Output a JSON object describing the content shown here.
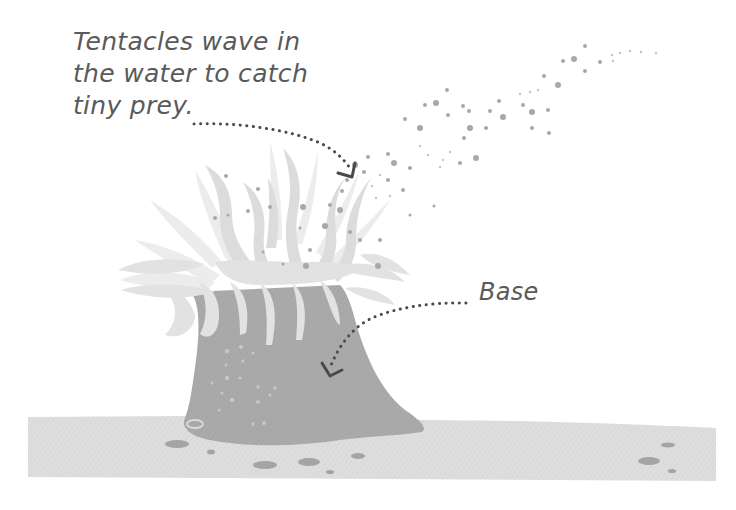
{
  "diagram": {
    "labels": {
      "tentacles": {
        "lines": [
          "Tentacles wave in",
          "the water to catch",
          "tiny prey."
        ]
      },
      "base": {
        "text": "Base"
      }
    },
    "colors": {
      "background": "#ffffff",
      "text": "#5a5a5a",
      "arrow": "#4a4a4a",
      "tentacles_light": "#e6e6e6",
      "tentacles_mid": "#d4d4d4",
      "body": "#a8a8a8",
      "seafloor": "#dcdcdc",
      "pebbles": "#a0a0a0",
      "particles": "#a6a6a6"
    }
  }
}
